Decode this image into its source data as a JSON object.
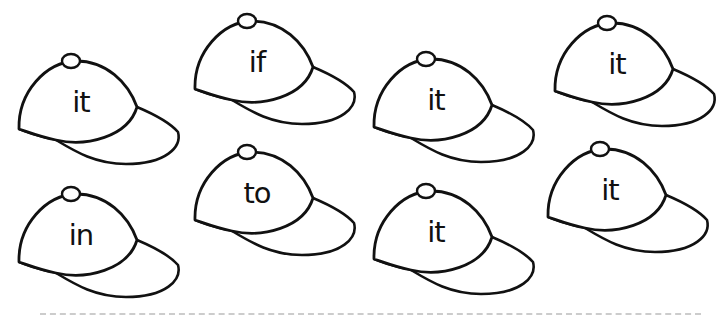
{
  "worksheet": {
    "caps": [
      {
        "word": "it",
        "x": 16,
        "y": 52
      },
      {
        "word": "if",
        "x": 192,
        "y": 12
      },
      {
        "word": "it",
        "x": 371,
        "y": 50
      },
      {
        "word": "it",
        "x": 552,
        "y": 14
      },
      {
        "word": "in",
        "x": 16,
        "y": 185
      },
      {
        "word": "to",
        "x": 192,
        "y": 143
      },
      {
        "word": "it",
        "x": 371,
        "y": 182
      },
      {
        "word": "it",
        "x": 545,
        "y": 140
      }
    ]
  },
  "colors": {
    "stroke": "#111111",
    "background": "#ffffff"
  }
}
